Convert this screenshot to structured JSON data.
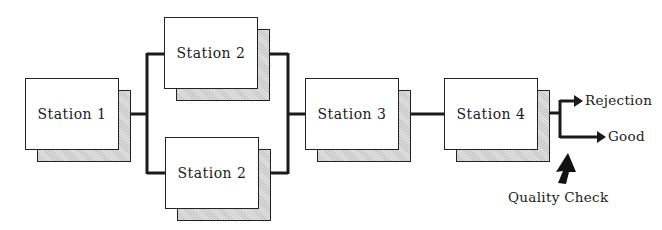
{
  "diagram": {
    "stations": [
      {
        "id": "station-1",
        "label": "Station 1"
      },
      {
        "id": "station-2-top",
        "label": "Station 2"
      },
      {
        "id": "station-2-bottom",
        "label": "Station 2"
      },
      {
        "id": "station-3",
        "label": "Station 3"
      },
      {
        "id": "station-4",
        "label": "Station 4"
      }
    ],
    "outputs": {
      "rejection": "Rejection",
      "good": "Good"
    },
    "quality_check": "Quality Check",
    "colors": {
      "line": "#1a1a1a",
      "box_fill": "#ffffff",
      "shadow_fill": "#d4d4d4"
    }
  }
}
